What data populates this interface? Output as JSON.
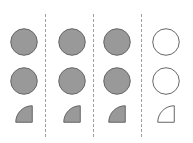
{
  "canvas": {
    "width": 193,
    "height": 143,
    "background": "#ffffff"
  },
  "style": {
    "fill_gray": "#999999",
    "fill_white": "#ffffff",
    "stroke_gray": "#666666",
    "divider_color": "#9aa0a6"
  },
  "dividers": [
    {
      "label": "divider-1",
      "x": 45,
      "y_top": 14,
      "y_bottom": 137
    },
    {
      "label": "divider-2",
      "x": 93,
      "y_top": 14,
      "y_bottom": 137
    },
    {
      "label": "divider-3",
      "x": 141,
      "y_top": 14,
      "y_bottom": 137
    }
  ],
  "grid": {
    "rows": 3,
    "columns": 4,
    "row_centers": [
      42,
      81,
      114
    ],
    "column_centers": [
      24,
      72,
      117,
      166
    ],
    "circle_diameter": 28,
    "wedge_size": 18
  },
  "cells": [
    {
      "row": 0,
      "col": 0,
      "shape": "circle",
      "fill": "filled",
      "name": "circle-r1-c1"
    },
    {
      "row": 0,
      "col": 1,
      "shape": "circle",
      "fill": "filled",
      "name": "circle-r1-c2"
    },
    {
      "row": 0,
      "col": 2,
      "shape": "circle",
      "fill": "filled",
      "name": "circle-r1-c3"
    },
    {
      "row": 0,
      "col": 3,
      "shape": "circle",
      "fill": "empty",
      "name": "circle-r1-c4"
    },
    {
      "row": 1,
      "col": 0,
      "shape": "circle",
      "fill": "filled",
      "name": "circle-r2-c1"
    },
    {
      "row": 1,
      "col": 1,
      "shape": "circle",
      "fill": "filled",
      "name": "circle-r2-c2"
    },
    {
      "row": 1,
      "col": 2,
      "shape": "circle",
      "fill": "filled",
      "name": "circle-r2-c3"
    },
    {
      "row": 1,
      "col": 3,
      "shape": "circle",
      "fill": "empty",
      "name": "circle-r2-c4"
    },
    {
      "row": 2,
      "col": 0,
      "shape": "quarter-circle",
      "fill": "filled",
      "name": "wedge-r3-c1"
    },
    {
      "row": 2,
      "col": 1,
      "shape": "quarter-circle",
      "fill": "filled",
      "name": "wedge-r3-c2"
    },
    {
      "row": 2,
      "col": 2,
      "shape": "quarter-circle",
      "fill": "filled",
      "name": "wedge-r3-c3"
    },
    {
      "row": 2,
      "col": 3,
      "shape": "quarter-circle",
      "fill": "empty",
      "name": "wedge-r3-c4"
    }
  ]
}
